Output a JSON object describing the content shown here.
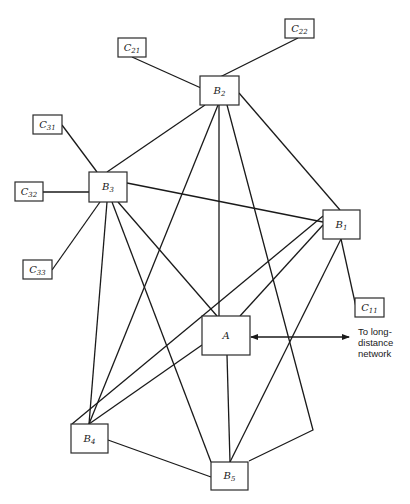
{
  "diagram": {
    "type": "network-topology",
    "external": {
      "label_lines": [
        "To long-",
        "distance",
        "network"
      ]
    },
    "nodes": [
      {
        "id": "C21",
        "main": "C",
        "sub": "21",
        "x": 118,
        "y": 38,
        "w": 28,
        "h": 19
      },
      {
        "id": "C22",
        "main": "C",
        "sub": "22",
        "x": 285,
        "y": 19,
        "w": 29,
        "h": 19
      },
      {
        "id": "B2",
        "main": "B",
        "sub": "2",
        "x": 200,
        "y": 76,
        "w": 39,
        "h": 29
      },
      {
        "id": "C31",
        "main": "C",
        "sub": "31",
        "x": 33,
        "y": 115,
        "w": 29,
        "h": 19
      },
      {
        "id": "C32",
        "main": "C",
        "sub": "32",
        "x": 15,
        "y": 182,
        "w": 28,
        "h": 19
      },
      {
        "id": "B3",
        "main": "B",
        "sub": "3",
        "x": 89,
        "y": 172,
        "w": 38,
        "h": 30
      },
      {
        "id": "C33",
        "main": "C",
        "sub": "33",
        "x": 23,
        "y": 260,
        "w": 29,
        "h": 19
      },
      {
        "id": "B1",
        "main": "B",
        "sub": "1",
        "x": 323,
        "y": 210,
        "w": 37,
        "h": 29
      },
      {
        "id": "C11",
        "main": "C",
        "sub": "11",
        "x": 355,
        "y": 298,
        "w": 29,
        "h": 19
      },
      {
        "id": "A",
        "main": "A",
        "sub": "",
        "x": 202,
        "y": 316,
        "w": 48,
        "h": 39
      },
      {
        "id": "B4",
        "main": "B",
        "sub": "4",
        "x": 71,
        "y": 424,
        "w": 37,
        "h": 29
      },
      {
        "id": "B5",
        "main": "B",
        "sub": "5",
        "x": 211,
        "y": 462,
        "w": 37,
        "h": 28
      }
    ],
    "edges": [
      {
        "from": "C21",
        "to": "B2",
        "points": [
          [
            132,
            57
          ],
          [
            201,
            88
          ]
        ]
      },
      {
        "from": "C22",
        "to": "B2",
        "points": [
          [
            298,
            38
          ],
          [
            220,
            77
          ]
        ]
      },
      {
        "from": "C31",
        "to": "B3",
        "points": [
          [
            62,
            125
          ],
          [
            97,
            172
          ]
        ]
      },
      {
        "from": "C32",
        "to": "B3",
        "points": [
          [
            43,
            192
          ],
          [
            89,
            192
          ]
        ]
      },
      {
        "from": "C33",
        "to": "B3",
        "points": [
          [
            52,
            270
          ],
          [
            100,
            202
          ]
        ]
      },
      {
        "from": "C11",
        "to": "B1",
        "points": [
          [
            356,
            307
          ],
          [
            341,
            239
          ]
        ]
      },
      {
        "from": "B2",
        "to": "B3",
        "points": [
          [
            205,
            105
          ],
          [
            107,
            172
          ]
        ]
      },
      {
        "from": "B2",
        "to": "B1",
        "points": [
          [
            239,
            93
          ],
          [
            340,
            210
          ]
        ]
      },
      {
        "from": "B2",
        "to": "A",
        "points": [
          [
            219,
            105
          ],
          [
            219,
            316
          ]
        ]
      },
      {
        "from": "B2",
        "to": "B4",
        "points": [
          [
            218,
            105
          ],
          [
            89,
            424
          ]
        ]
      },
      {
        "from": "B2",
        "to": "B5",
        "points": [
          [
            227,
            105
          ],
          [
            313,
            430
          ],
          [
            249,
            461
          ]
        ]
      },
      {
        "from": "B3",
        "to": "B1",
        "points": [
          [
            127,
            183
          ],
          [
            323,
            222
          ]
        ]
      },
      {
        "from": "B3",
        "to": "A",
        "points": [
          [
            118,
            202
          ],
          [
            217,
            316
          ]
        ]
      },
      {
        "from": "B3",
        "to": "B4",
        "points": [
          [
            107,
            202
          ],
          [
            89,
            424
          ]
        ]
      },
      {
        "from": "B3",
        "to": "B5",
        "points": [
          [
            112,
            202
          ],
          [
            211,
            462
          ]
        ]
      },
      {
        "from": "B1",
        "to": "A",
        "points": [
          [
            323,
            225
          ],
          [
            240,
            316
          ]
        ]
      },
      {
        "from": "B1",
        "to": "B4",
        "points": [
          [
            323,
            216
          ],
          [
            72,
            424
          ]
        ]
      },
      {
        "from": "B1",
        "to": "B5",
        "points": [
          [
            341,
            239
          ],
          [
            230,
            462
          ]
        ]
      },
      {
        "from": "A",
        "to": "B4",
        "points": [
          [
            202,
            345
          ],
          [
            89,
            424
          ]
        ]
      },
      {
        "from": "A",
        "to": "B5",
        "points": [
          [
            227,
            355
          ],
          [
            230,
            462
          ]
        ]
      },
      {
        "from": "B4",
        "to": "B5",
        "points": [
          [
            108,
            440
          ],
          [
            211,
            477
          ]
        ]
      }
    ],
    "external_link": {
      "from": "A",
      "points": [
        [
          251,
          337
        ],
        [
          349,
          337
        ]
      ],
      "arrow": "both"
    }
  }
}
